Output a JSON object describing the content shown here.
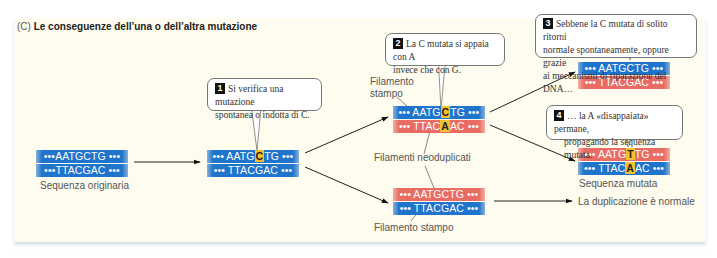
{
  "title": {
    "prefix": "(C)",
    "text": "Le conseguenze dell’una o dell’altra mutazione"
  },
  "colors": {
    "template_strand": "#1f74cc",
    "new_strand": "#e86c64",
    "mutation_highlight": "#f2c12e",
    "background": "#fdfcee"
  },
  "strands": {
    "original": {
      "top": "•••AATGCTG •••",
      "bottom": "•••TTACGAC •••",
      "caption": "Sequenza originaria"
    },
    "mutated": {
      "top_pre": "••• AATG",
      "top_mut": "C",
      "top_post": "TG •••",
      "bottom": "••• TTACGAC •••"
    },
    "mispaired": {
      "top_pre": "••• AATG",
      "top_mut": "C",
      "top_post": "TG •••",
      "bottom_pre": "••• TTAC",
      "bottom_mut": "A",
      "bottom_post": "AC •••"
    },
    "normal_copy": {
      "top": "••• AATGCTG •••",
      "bottom": "••• TTACGAC •••"
    },
    "repaired": {
      "top": "••• AATGCTG •••",
      "bottom": "••• TTACGAC •••"
    },
    "final_mutated": {
      "top_pre": "••• AATG",
      "top_mut": "T",
      "top_post": "TG •••",
      "bottom_pre": "••• TTAC",
      "bottom_mut": "A",
      "bottom_post": "AC •••",
      "caption": "Sequenza mutata"
    }
  },
  "labels": {
    "template_top": "Filamento\nstampo",
    "template_top_l1": "Filamento",
    "template_top_l2": "stampo",
    "new_strands": "Filamenti neoduplicati",
    "template_bottom": "Filamento stampo",
    "normal_result": "La duplicazione è normale"
  },
  "callouts": [
    {
      "num": "1",
      "line1": "Si verifica una mutazione",
      "line2": "spontanea o indotta di C."
    },
    {
      "num": "2",
      "line1": "La C mutata si appaia con A",
      "line2": "invece che con G."
    },
    {
      "num": "3",
      "line1": "Sebbene la C mutata di solito ritorni",
      "line2": "normale spontaneamente, oppure grazie",
      "line3": "ai meccanismi di riparazione del DNA…"
    },
    {
      "num": "4",
      "line1": "… la A «disappaiata» permane,",
      "line2": "propagando la sequenza mutata."
    }
  ]
}
